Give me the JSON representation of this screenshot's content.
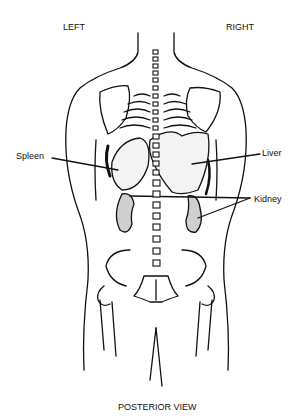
{
  "diagram": {
    "title": "POSTERIOR VIEW",
    "orientation": {
      "left": "LEFT",
      "right": "RIGHT"
    },
    "labels": {
      "spleen": "Spleen",
      "liver": "Liver",
      "kidney": "Kidney"
    },
    "colors": {
      "line": "#111111",
      "background": "#ffffff"
    }
  }
}
